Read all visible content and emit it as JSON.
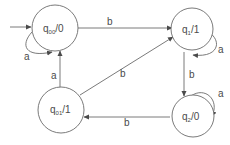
{
  "diagram": {
    "type": "moore-state-machine",
    "states": [
      {
        "id": "q00",
        "name": "q",
        "sub": "00",
        "output": "/0",
        "initial": true
      },
      {
        "id": "q1",
        "name": "q",
        "sub": "1",
        "output": "/1",
        "initial": false
      },
      {
        "id": "q2",
        "name": "q",
        "sub": "2",
        "output": "/0",
        "initial": false
      },
      {
        "id": "q01",
        "name": "q",
        "sub": "01",
        "output": "/1",
        "initial": false
      }
    ],
    "transitions": [
      {
        "from": "q00",
        "to": "q00",
        "label": "a"
      },
      {
        "from": "q00",
        "to": "q1",
        "label": "b"
      },
      {
        "from": "q1",
        "to": "q1",
        "label": "a"
      },
      {
        "from": "q1",
        "to": "q2",
        "label": "b"
      },
      {
        "from": "q2",
        "to": "q2",
        "label": "a"
      },
      {
        "from": "q2",
        "to": "q01",
        "label": "b"
      },
      {
        "from": "q01",
        "to": "q00",
        "label": "a"
      },
      {
        "from": "q01",
        "to": "q1",
        "label": "b"
      }
    ],
    "colors": {
      "stroke": "#6b6b6b",
      "text": "#4a4a4a",
      "background": "#ffffff"
    }
  }
}
